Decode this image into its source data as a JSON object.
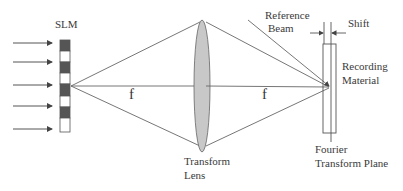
{
  "diagram": {
    "type": "optical-setup",
    "labels": {
      "slm": "SLM",
      "focal_left": "f",
      "focal_right": "f",
      "reference_beam_line1": "Reference",
      "reference_beam_line2": "Beam",
      "shift": "Shift",
      "recording_material_line1": "Recording",
      "recording_material_line2": "Material",
      "transform_lens_line1": "Transform",
      "transform_lens_line2": "Lens",
      "fourier_plane_line1": "Fourier",
      "fourier_plane_line2": "Transform Plane"
    },
    "components": [
      "Input light arrows (5)",
      "SLM (alternating dark/light pixels)",
      "Transform Lens",
      "Recording Material",
      "Fourier Transform Plane",
      "Reference Beam"
    ],
    "colors": {
      "line": "#555555",
      "slm_dark": "#555555",
      "slm_light": "#ffffff",
      "lens_fill": "#c8c8c8"
    }
  }
}
